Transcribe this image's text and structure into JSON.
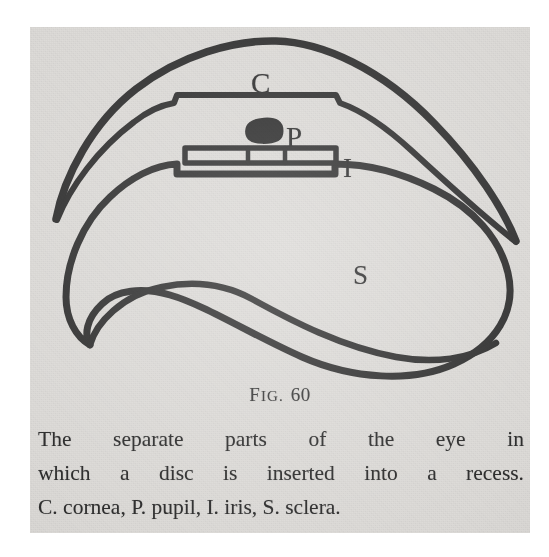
{
  "figure": {
    "kind": "anatomical-line-drawing",
    "ink_color": "#2f2f2f",
    "paper_color": "#dddbd8",
    "labels": [
      {
        "key": "cornea",
        "text": "C",
        "meaning": "cornea"
      },
      {
        "key": "pupil",
        "text": "P",
        "meaning": "pupil"
      },
      {
        "key": "iris",
        "text": "I",
        "meaning": "iris"
      },
      {
        "key": "sclera",
        "text": "S",
        "meaning": "sclera"
      }
    ],
    "parts": [
      {
        "name": "cornea-outline",
        "description": "upper crescent arc with tapered tips"
      },
      {
        "name": "iris-disc",
        "description": "horizontal bar divided into three segments"
      },
      {
        "name": "pupil-blob",
        "description": "small solid dark spot above the disc"
      },
      {
        "name": "sclera-outline",
        "description": "lower kidney-shaped body with a recess notch on top"
      }
    ]
  },
  "fig_number": {
    "prefix_first_letter": "F",
    "prefix_rest": "IG.",
    "number": "60"
  },
  "caption": {
    "lines": [
      {
        "words": [
          "The",
          "separate",
          "parts",
          "of",
          "the",
          "eye",
          "in"
        ],
        "justified": true
      },
      {
        "words": [
          "which",
          "a",
          "disc",
          "is",
          "inserted",
          "into",
          "a",
          "recess."
        ],
        "justified": true
      },
      {
        "words": [
          "C.",
          "cornea,",
          "P.",
          "pupil,",
          "I.",
          "iris,",
          "S.",
          "sclera."
        ],
        "justified": false,
        "text": "C. cornea, P. pupil, I. iris, S. sclera."
      }
    ]
  }
}
